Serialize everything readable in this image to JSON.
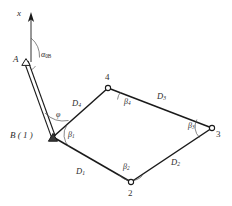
{
  "figure": {
    "kind": "mechanism-kinematic-diagram",
    "background_color": "#ffffff",
    "line_color": "#1a1a1a",
    "text_color": "#2b2b2b",
    "width": 232,
    "height": 206
  },
  "axis": {
    "label": "x",
    "arrow": "up"
  },
  "points": {
    "a_label": "A",
    "b_label": "B ( 1 )",
    "node2_label": "2",
    "node3_label": "3",
    "node4_label": "4"
  },
  "angles": {
    "alpha_symbol": "α",
    "alpha_subscript": "0B",
    "phi_symbol": "φ",
    "beta_symbol": "β",
    "beta1_subscript": "1",
    "beta2_subscript": "2",
    "beta3_subscript": "3",
    "beta4_subscript": "4"
  },
  "links": {
    "d_symbol": "D",
    "d1_subscript": "1",
    "d2_subscript": "2",
    "d3_subscript": "3",
    "d4_subscript": "4"
  },
  "geometry": {
    "a": [
      26,
      62
    ],
    "b": [
      53,
      137
    ],
    "n2": [
      131,
      182
    ],
    "n3": [
      212,
      128
    ],
    "n4": [
      108,
      88
    ],
    "axis_top": [
      31,
      13
    ],
    "axis_base": [
      31,
      62
    ]
  }
}
